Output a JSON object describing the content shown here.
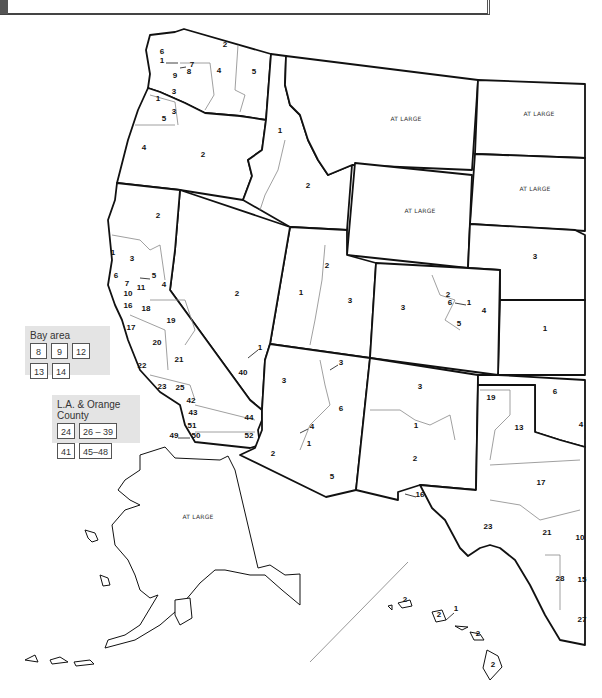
{
  "map": {
    "title": "Congressional districts — Western United States",
    "at_large_label": "AT LARGE",
    "states": [
      {
        "name": "Washington",
        "districts": [
          "1",
          "2",
          "3",
          "4",
          "5",
          "6",
          "7",
          "8",
          "9"
        ]
      },
      {
        "name": "Oregon",
        "districts": [
          "1",
          "2",
          "3",
          "4",
          "5"
        ]
      },
      {
        "name": "Idaho",
        "districts": [
          "1",
          "2"
        ]
      },
      {
        "name": "Montana",
        "districts": [
          "AT LARGE"
        ]
      },
      {
        "name": "Wyoming",
        "districts": [
          "AT LARGE"
        ]
      },
      {
        "name": "North Dakota",
        "districts": [
          "AT LARGE"
        ]
      },
      {
        "name": "South Dakota",
        "districts": [
          "AT LARGE"
        ]
      },
      {
        "name": "Nevada",
        "districts": [
          "1",
          "2"
        ]
      },
      {
        "name": "Utah",
        "districts": [
          "1",
          "2",
          "3"
        ]
      },
      {
        "name": "Colorado",
        "districts": [
          "1",
          "2",
          "3",
          "4",
          "5",
          "6"
        ]
      },
      {
        "name": "Nebraska",
        "districts": [
          "3"
        ]
      },
      {
        "name": "Kansas",
        "districts": [
          "1"
        ]
      },
      {
        "name": "Arizona",
        "districts": [
          "1",
          "2",
          "3",
          "4",
          "5",
          "6"
        ]
      },
      {
        "name": "New Mexico",
        "districts": [
          "1",
          "2",
          "3"
        ]
      },
      {
        "name": "Oklahoma",
        "districts": [
          "4",
          "6"
        ]
      },
      {
        "name": "Texas",
        "districts": [
          "13",
          "16",
          "17",
          "19",
          "21",
          "23",
          "28",
          "10",
          "15",
          "27"
        ]
      },
      {
        "name": "California",
        "districts": [
          "1",
          "2",
          "3",
          "4",
          "5",
          "6",
          "7",
          "10",
          "11",
          "16",
          "17",
          "18",
          "19",
          "20",
          "21",
          "22",
          "23",
          "25",
          "40",
          "42",
          "43",
          "44",
          "49",
          "50",
          "51",
          "52"
        ]
      },
      {
        "name": "Alaska",
        "districts": [
          "AT LARGE"
        ]
      },
      {
        "name": "Hawaii",
        "districts": [
          "1",
          "2"
        ]
      }
    ],
    "labels": [
      {
        "t": "2",
        "x": 225,
        "y": 47
      },
      {
        "t": "6",
        "x": 162,
        "y": 54
      },
      {
        "t": "1",
        "x": 162,
        "y": 63
      },
      {
        "t": "7",
        "x": 192,
        "y": 67
      },
      {
        "t": "9",
        "x": 175,
        "y": 78
      },
      {
        "t": "8",
        "x": 189,
        "y": 74
      },
      {
        "t": "4",
        "x": 219,
        "y": 73
      },
      {
        "t": "5",
        "x": 254,
        "y": 74
      },
      {
        "t": "3",
        "x": 174,
        "y": 94
      },
      {
        "t": "1",
        "x": 158,
        "y": 101
      },
      {
        "t": "3",
        "x": 174,
        "y": 114
      },
      {
        "t": "5",
        "x": 164,
        "y": 121
      },
      {
        "t": "4",
        "x": 144,
        "y": 150
      },
      {
        "t": "2",
        "x": 203,
        "y": 157
      },
      {
        "t": "1",
        "x": 280,
        "y": 133
      },
      {
        "t": "2",
        "x": 308,
        "y": 188
      },
      {
        "t": "2",
        "x": 158,
        "y": 218
      },
      {
        "t": "1",
        "x": 113,
        "y": 255
      },
      {
        "t": "3",
        "x": 132,
        "y": 261
      },
      {
        "t": "6",
        "x": 116,
        "y": 278
      },
      {
        "t": "5",
        "x": 154,
        "y": 278
      },
      {
        "t": "7",
        "x": 127,
        "y": 286
      },
      {
        "t": "4",
        "x": 164,
        "y": 287
      },
      {
        "t": "10",
        "x": 128,
        "y": 296
      },
      {
        "t": "11",
        "x": 141,
        "y": 290
      },
      {
        "t": "16",
        "x": 128,
        "y": 308
      },
      {
        "t": "18",
        "x": 146,
        "y": 311
      },
      {
        "t": "17",
        "x": 131,
        "y": 330
      },
      {
        "t": "19",
        "x": 171,
        "y": 323
      },
      {
        "t": "20",
        "x": 157,
        "y": 345
      },
      {
        "t": "21",
        "x": 179,
        "y": 362
      },
      {
        "t": "22",
        "x": 142,
        "y": 368
      },
      {
        "t": "23",
        "x": 162,
        "y": 389
      },
      {
        "t": "25",
        "x": 180,
        "y": 390
      },
      {
        "t": "40",
        "x": 243,
        "y": 375
      },
      {
        "t": "42",
        "x": 191,
        "y": 403
      },
      {
        "t": "43",
        "x": 193,
        "y": 415
      },
      {
        "t": "44",
        "x": 249,
        "y": 420
      },
      {
        "t": "51",
        "x": 192,
        "y": 428
      },
      {
        "t": "50",
        "x": 196,
        "y": 438
      },
      {
        "t": "52",
        "x": 249,
        "y": 438
      },
      {
        "t": "49",
        "x": 174,
        "y": 438
      },
      {
        "t": "2",
        "x": 237,
        "y": 296
      },
      {
        "t": "1",
        "x": 260,
        "y": 350
      },
      {
        "t": "1",
        "x": 301,
        "y": 295
      },
      {
        "t": "2",
        "x": 327,
        "y": 268
      },
      {
        "t": "3",
        "x": 350,
        "y": 303
      },
      {
        "t": "3",
        "x": 403,
        "y": 310
      },
      {
        "t": "2",
        "x": 448,
        "y": 297
      },
      {
        "t": "6",
        "x": 450,
        "y": 305
      },
      {
        "t": "1",
        "x": 469,
        "y": 305
      },
      {
        "t": "4",
        "x": 484,
        "y": 313
      },
      {
        "t": "5",
        "x": 459,
        "y": 326
      },
      {
        "t": "3",
        "x": 535,
        "y": 259
      },
      {
        "t": "1",
        "x": 545,
        "y": 331
      },
      {
        "t": "3",
        "x": 284,
        "y": 383
      },
      {
        "t": "3",
        "x": 341,
        "y": 365
      },
      {
        "t": "6",
        "x": 341,
        "y": 411
      },
      {
        "t": "4",
        "x": 312,
        "y": 429
      },
      {
        "t": "1",
        "x": 309,
        "y": 446
      },
      {
        "t": "2",
        "x": 273,
        "y": 456
      },
      {
        "t": "5",
        "x": 332,
        "y": 479
      },
      {
        "t": "3",
        "x": 420,
        "y": 389
      },
      {
        "t": "1",
        "x": 416,
        "y": 428
      },
      {
        "t": "2",
        "x": 415,
        "y": 461
      },
      {
        "t": "16",
        "x": 420,
        "y": 497
      },
      {
        "t": "19",
        "x": 491,
        "y": 400
      },
      {
        "t": "13",
        "x": 519,
        "y": 430
      },
      {
        "t": "6",
        "x": 555,
        "y": 394
      },
      {
        "t": "4",
        "x": 581,
        "y": 427
      },
      {
        "t": "17",
        "x": 541,
        "y": 485
      },
      {
        "t": "23",
        "x": 488,
        "y": 529
      },
      {
        "t": "21",
        "x": 547,
        "y": 535
      },
      {
        "t": "10",
        "x": 580,
        "y": 540
      },
      {
        "t": "28",
        "x": 560,
        "y": 581
      },
      {
        "t": "15",
        "x": 582,
        "y": 582
      },
      {
        "t": "27",
        "x": 582,
        "y": 622
      },
      {
        "t": "2",
        "x": 439,
        "y": 617
      },
      {
        "t": "1",
        "x": 456,
        "y": 611
      },
      {
        "t": "2",
        "x": 478,
        "y": 636
      },
      {
        "t": "2",
        "x": 493,
        "y": 667
      },
      {
        "t": "2",
        "x": 405,
        "y": 602
      }
    ],
    "at_large": [
      {
        "state": "Montana",
        "x": 406,
        "y": 121
      },
      {
        "state": "North Dakota",
        "x": 539,
        "y": 116
      },
      {
        "state": "Wyoming",
        "x": 420,
        "y": 213
      },
      {
        "state": "South Dakota",
        "x": 535,
        "y": 191
      },
      {
        "state": "Alaska",
        "x": 198,
        "y": 519
      }
    ]
  },
  "insets": {
    "bay_area": {
      "title": "Bay area",
      "boxes": [
        "8",
        "9",
        "12",
        "13",
        "14"
      ]
    },
    "la_orange": {
      "title": "L.A. & Orange County",
      "boxes": [
        "24",
        "26 – 39",
        "41",
        "45–48"
      ]
    }
  }
}
